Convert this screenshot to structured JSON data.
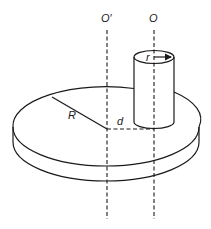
{
  "diagram": {
    "labels": {
      "axis_disk": "O′",
      "axis_cylinder": "O",
      "disk_radius": "R",
      "cylinder_radius": "r",
      "axis_separation": "d"
    },
    "colors": {
      "line": "#1a1a1a",
      "background": "#ffffff"
    }
  }
}
